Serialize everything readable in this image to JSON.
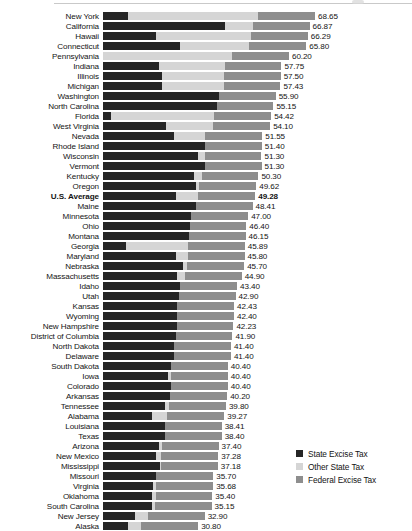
{
  "chart_data": {
    "type": "bar",
    "orientation": "horizontal",
    "stacked": true,
    "title": "",
    "subtitle": "",
    "xlabel": "",
    "ylabel": "",
    "grid": false,
    "legend_position": "right-bottom",
    "xlim": [
      0,
      68.65
    ],
    "px_per_unit": 3.09,
    "legend": [
      {
        "label": "State Excise Tax",
        "color": "#262626",
        "swatch_name": "state-excise-tax-swatch"
      },
      {
        "label": "Other State Tax",
        "color": "#d5d5d5",
        "swatch_name": "other-state-tax-swatch"
      },
      {
        "label": "Federal Excise Tax",
        "color": "#8e8e8e",
        "swatch_name": "federal-excise-tax-swatch"
      }
    ],
    "series": [
      {
        "name": "State Excise Tax",
        "color": "#262626"
      },
      {
        "name": "Other State Tax",
        "color": "#d5d5d5"
      },
      {
        "name": "Federal Excise Tax",
        "color": "#8e8e8e"
      }
    ],
    "categories": [
      "New York",
      "California",
      "Hawaii",
      "Connecticut",
      "Pennsylvania",
      "Indiana",
      "Illinois",
      "Michigan",
      "Washington",
      "North Carolina",
      "Florida",
      "West Virginia",
      "Nevada",
      "Rhode Island",
      "Wisconsin",
      "Vermont",
      "Kentucky",
      "Oregon",
      "U.S. Average",
      "Maine",
      "Minnesota",
      "Ohio",
      "Montana",
      "Georgia",
      "Maryland",
      "Nebraska",
      "Massachusetts",
      "Idaho",
      "Utah",
      "Kansas",
      "Wyoming",
      "New Hampshire",
      "District of Columbia",
      "North Dakota",
      "Delaware",
      "South Dakota",
      "Iowa",
      "Colorado",
      "Arkansas",
      "Tennessee",
      "Alabama",
      "Louisiana",
      "Texas",
      "Arizona",
      "New Mexico",
      "Mississippi",
      "Missouri",
      "Virginia",
      "Oklahoma",
      "South Carolina",
      "New Jersey",
      "Alaska"
    ],
    "values": [
      68.65,
      66.87,
      66.29,
      65.8,
      60.2,
      57.75,
      57.5,
      57.43,
      55.9,
      55.15,
      54.42,
      54.1,
      51.55,
      51.4,
      51.3,
      51.3,
      50.3,
      49.62,
      49.28,
      48.41,
      47.0,
      46.4,
      46.15,
      45.89,
      45.8,
      45.7,
      44.9,
      43.4,
      42.9,
      42.43,
      42.4,
      42.23,
      41.9,
      41.4,
      41.4,
      40.4,
      40.4,
      40.4,
      40.2,
      39.8,
      39.27,
      38.41,
      38.4,
      37.4,
      37.28,
      37.18,
      35.7,
      35.68,
      35.4,
      35.15,
      32.9,
      30.8
    ],
    "rows": [
      {
        "label": "New York",
        "state": 8.05,
        "other": 42.2,
        "federal": 18.4,
        "total_label": "68.65"
      },
      {
        "label": "California",
        "state": 39.5,
        "other": 8.97,
        "federal": 18.4,
        "total_label": "66.87"
      },
      {
        "label": "Hawaii",
        "state": 17.0,
        "other": 30.89,
        "federal": 18.4,
        "total_label": "66.29"
      },
      {
        "label": "Connecticut",
        "state": 25.0,
        "other": 22.4,
        "federal": 18.4,
        "total_label": "65.80"
      },
      {
        "label": "Pennsylvania",
        "state": 0.0,
        "other": 41.8,
        "federal": 18.4,
        "total_label": "60.20"
      },
      {
        "label": "Indiana",
        "state": 18.0,
        "other": 21.35,
        "federal": 18.4,
        "total_label": "57.75"
      },
      {
        "label": "Illinois",
        "state": 19.0,
        "other": 20.1,
        "federal": 18.4,
        "total_label": "57.50"
      },
      {
        "label": "Michigan",
        "state": 19.0,
        "other": 20.03,
        "federal": 18.4,
        "total_label": "57.43"
      },
      {
        "label": "Washington",
        "state": 37.5,
        "other": 0.0,
        "federal": 18.4,
        "total_label": "55.90"
      },
      {
        "label": "North Carolina",
        "state": 36.75,
        "other": 0.0,
        "federal": 18.4,
        "total_label": "55.15"
      },
      {
        "label": "Florida",
        "state": 2.54,
        "other": 33.48,
        "federal": 18.4,
        "total_label": "54.42"
      },
      {
        "label": "West Virginia",
        "state": 20.5,
        "other": 15.2,
        "federal": 18.4,
        "total_label": "54.10"
      },
      {
        "label": "Nevada",
        "state": 23.0,
        "other": 10.15,
        "federal": 18.4,
        "total_label": "51.55"
      },
      {
        "label": "Rhode Island",
        "state": 33.0,
        "other": 0.0,
        "federal": 18.4,
        "total_label": "51.40"
      },
      {
        "label": "Wisconsin",
        "state": 30.9,
        "other": 2.0,
        "federal": 18.4,
        "total_label": "51.30"
      },
      {
        "label": "Vermont",
        "state": 32.9,
        "other": 0.0,
        "federal": 18.4,
        "total_label": "51.30"
      },
      {
        "label": "Kentucky",
        "state": 29.4,
        "other": 2.5,
        "federal": 18.4,
        "total_label": "50.30"
      },
      {
        "label": "Oregon",
        "state": 30.0,
        "other": 1.22,
        "federal": 18.4,
        "total_label": "49.62"
      },
      {
        "label": "U.S. Average",
        "state": 23.5,
        "other": 7.38,
        "federal": 18.4,
        "total_label": "49.28"
      },
      {
        "label": "Maine",
        "state": 30.01,
        "other": 0.0,
        "federal": 18.4,
        "total_label": "48.41"
      },
      {
        "label": "Minnesota",
        "state": 28.6,
        "other": 0.0,
        "federal": 18.4,
        "total_label": "47.00"
      },
      {
        "label": "Ohio",
        "state": 28.0,
        "other": 0.0,
        "federal": 18.4,
        "total_label": "46.40"
      },
      {
        "label": "Montana",
        "state": 27.75,
        "other": 0.0,
        "federal": 18.4,
        "total_label": "46.15"
      },
      {
        "label": "Georgia",
        "state": 7.5,
        "other": 19.99,
        "federal": 18.4,
        "total_label": "45.89"
      },
      {
        "label": "Maryland",
        "state": 23.5,
        "other": 3.9,
        "federal": 18.4,
        "total_label": "45.80"
      },
      {
        "label": "Nebraska",
        "state": 26.0,
        "other": 1.3,
        "federal": 18.4,
        "total_label": "45.70"
      },
      {
        "label": "Massachusetts",
        "state": 24.0,
        "other": 2.5,
        "federal": 18.4,
        "total_label": "44.90"
      },
      {
        "label": "Idaho",
        "state": 25.0,
        "other": 0.0,
        "federal": 18.4,
        "total_label": "43.40"
      },
      {
        "label": "Utah",
        "state": 24.5,
        "other": 0.0,
        "federal": 18.4,
        "total_label": "42.90"
      },
      {
        "label": "Kansas",
        "state": 24.03,
        "other": 0.0,
        "federal": 18.4,
        "total_label": "42.43"
      },
      {
        "label": "Wyoming",
        "state": 24.0,
        "other": 0.0,
        "federal": 18.4,
        "total_label": "42.40"
      },
      {
        "label": "New Hampshire",
        "state": 23.83,
        "other": 0.0,
        "federal": 18.4,
        "total_label": "42.23"
      },
      {
        "label": "District of Columbia",
        "state": 23.5,
        "other": 0.0,
        "federal": 18.4,
        "total_label": "41.90"
      },
      {
        "label": "North Dakota",
        "state": 23.0,
        "other": 0.0,
        "federal": 18.4,
        "total_label": "41.40"
      },
      {
        "label": "Delaware",
        "state": 23.0,
        "other": 0.0,
        "federal": 18.4,
        "total_label": "41.40"
      },
      {
        "label": "South Dakota",
        "state": 22.0,
        "other": 0.0,
        "federal": 18.4,
        "total_label": "40.40"
      },
      {
        "label": "Iowa",
        "state": 21.0,
        "other": 1.0,
        "federal": 18.4,
        "total_label": "40.40"
      },
      {
        "label": "Colorado",
        "state": 22.0,
        "other": 0.0,
        "federal": 18.4,
        "total_label": "40.40"
      },
      {
        "label": "Arkansas",
        "state": 21.8,
        "other": 0.0,
        "federal": 18.4,
        "total_label": "40.20"
      },
      {
        "label": "Tennessee",
        "state": 20.0,
        "other": 1.4,
        "federal": 18.4,
        "total_label": "39.80"
      },
      {
        "label": "Alabama",
        "state": 16.0,
        "other": 4.87,
        "federal": 18.4,
        "total_label": "39.27"
      },
      {
        "label": "Louisiana",
        "state": 20.01,
        "other": 0.0,
        "federal": 18.4,
        "total_label": "38.41"
      },
      {
        "label": "Texas",
        "state": 20.0,
        "other": 0.0,
        "federal": 18.4,
        "total_label": "38.40"
      },
      {
        "label": "Arizona",
        "state": 18.0,
        "other": 1.0,
        "federal": 18.4,
        "total_label": "37.40"
      },
      {
        "label": "New Mexico",
        "state": 17.0,
        "other": 1.88,
        "federal": 18.4,
        "total_label": "37.28"
      },
      {
        "label": "Mississippi",
        "state": 18.4,
        "other": 0.38,
        "federal": 18.4,
        "total_label": "37.18"
      },
      {
        "label": "Missouri",
        "state": 17.0,
        "other": 0.3,
        "federal": 18.4,
        "total_label": "35.70"
      },
      {
        "label": "Virginia",
        "state": 16.2,
        "other": 1.08,
        "federal": 18.4,
        "total_label": "35.68"
      },
      {
        "label": "Oklahoma",
        "state": 16.0,
        "other": 1.0,
        "federal": 18.4,
        "total_label": "35.40"
      },
      {
        "label": "South Carolina",
        "state": 16.0,
        "other": 0.75,
        "federal": 18.4,
        "total_label": "35.15"
      },
      {
        "label": "New Jersey",
        "state": 10.5,
        "other": 4.0,
        "federal": 18.4,
        "total_label": "32.90"
      },
      {
        "label": "Alaska",
        "state": 8.0,
        "other": 4.4,
        "federal": 18.4,
        "total_label": "30.80"
      }
    ]
  }
}
